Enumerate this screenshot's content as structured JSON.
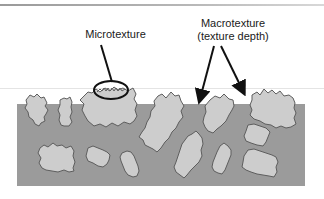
{
  "diagram": {
    "labels": {
      "microtexture": "Microtexture",
      "macrotexture_line1": "Macrotexture",
      "macrotexture_line2": "(texture depth)"
    },
    "colors": {
      "binder": "#9b9b9b",
      "aggregate_fill": "#cdcdcd",
      "aggregate_outline": "#6a6a6a",
      "arrow": "#111111",
      "background": "#ffffff"
    },
    "elements": {
      "binder_layer": "gray matrix (asphalt binder)",
      "aggregate_count": 15,
      "callout_microtexture": "ellipse around aggregate surface asperities",
      "callout_macrotexture_arrows": 2
    }
  }
}
